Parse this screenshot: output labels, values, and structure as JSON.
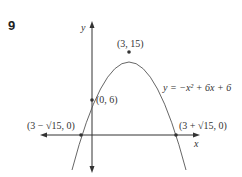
{
  "problem_number": "9",
  "axes": {
    "x_label": "x",
    "y_label": "y"
  },
  "equation": "y = −x² + 6x + 6",
  "points": {
    "vertex": "(3, 15)",
    "y_intercept": "(0, 6)",
    "root_left": "(3 − √15, 0)",
    "root_right": "(3 + √15, 0)"
  },
  "colors": {
    "curve": "#555555",
    "axes": "#333333",
    "text": "#333333"
  }
}
